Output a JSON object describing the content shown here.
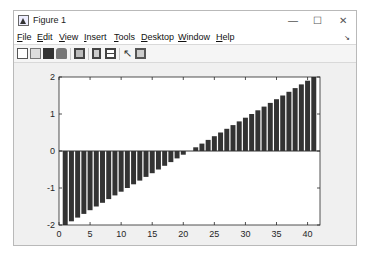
{
  "window": {
    "title": "Figure 1",
    "controls": {
      "minimize": "—",
      "maximize": "☐",
      "close": "✕"
    }
  },
  "menubar": {
    "items": [
      {
        "label": "File",
        "accel": "F",
        "rest": "ile"
      },
      {
        "label": "Edit",
        "accel": "E",
        "rest": "dit"
      },
      {
        "label": "View",
        "accel": "V",
        "rest": "iew"
      },
      {
        "label": "Insert",
        "accel": "I",
        "rest": "nsert"
      },
      {
        "label": "Tools",
        "accel": "T",
        "rest": "ools"
      },
      {
        "label": "Desktop",
        "accel": "D",
        "rest": "esktop"
      },
      {
        "label": "Window",
        "accel": "W",
        "rest": "indow"
      },
      {
        "label": "Help",
        "accel": "H",
        "rest": "elp"
      }
    ],
    "dock_arrow": "↘"
  },
  "toolbar": {
    "buttons": [
      "new-figure-icon",
      "open-file-icon",
      "save-icon",
      "print-icon",
      "link-plot-icon",
      "insert-colorbar-icon",
      "insert-legend-icon",
      "edit-plot-icon",
      "property-inspector-icon"
    ]
  },
  "chart_data": {
    "type": "bar",
    "title": "",
    "xlabel": "",
    "ylabel": "",
    "x": [
      1,
      2,
      3,
      4,
      5,
      6,
      7,
      8,
      9,
      10,
      11,
      12,
      13,
      14,
      15,
      16,
      17,
      18,
      19,
      20,
      21,
      22,
      23,
      24,
      25,
      26,
      27,
      28,
      29,
      30,
      31,
      32,
      33,
      34,
      35,
      36,
      37,
      38,
      39,
      40,
      41
    ],
    "values": [
      -2.0,
      -1.9,
      -1.8,
      -1.7,
      -1.6,
      -1.5,
      -1.4,
      -1.3,
      -1.2,
      -1.1,
      -1.0,
      -0.9,
      -0.8,
      -0.7,
      -0.6,
      -0.5,
      -0.4,
      -0.3,
      -0.2,
      -0.1,
      0.0,
      0.1,
      0.2,
      0.3,
      0.4,
      0.5,
      0.6,
      0.7,
      0.8,
      0.9,
      1.0,
      1.1,
      1.2,
      1.3,
      1.4,
      1.5,
      1.6,
      1.7,
      1.8,
      1.9,
      2.0
    ],
    "xlim": [
      0,
      42
    ],
    "ylim": [
      -2,
      2
    ],
    "xticks": [
      0,
      5,
      10,
      15,
      20,
      25,
      30,
      35,
      40
    ],
    "yticks": [
      -2,
      -1,
      0,
      1,
      2
    ],
    "bar_color": "#333333",
    "grid": false,
    "legend": null
  }
}
